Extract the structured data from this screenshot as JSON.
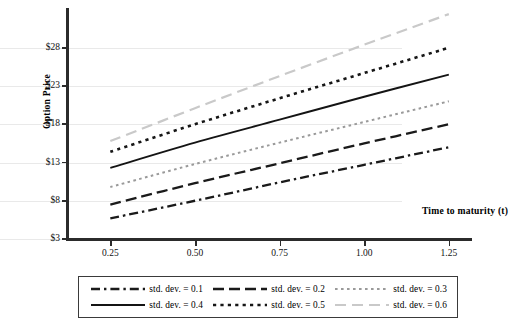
{
  "chart_data": {
    "type": "line",
    "title": "",
    "xlabel": "Time to maturity (t)",
    "ylabel": "Option Price",
    "xlim": [
      0.125,
      1.3125
    ],
    "ylim": [
      3,
      33.2
    ],
    "grid": true,
    "legend_position": "bottom",
    "xticks": [
      0.25,
      0.5,
      0.75,
      1.0,
      1.25
    ],
    "xtick_labels": [
      "0.25",
      "0.50",
      "0.75",
      "1.00",
      "1.25"
    ],
    "yticks": [
      3,
      8,
      13,
      18,
      23,
      28
    ],
    "ytick_labels": [
      "$3",
      "$8",
      "$13",
      "$18",
      "$23",
      "$28"
    ],
    "x": [
      0.25,
      0.5,
      0.75,
      1.0,
      1.25
    ],
    "series": [
      {
        "name": "std. dev. = 0.1",
        "style": "dash-dot",
        "color": "#1a1a1a",
        "values": [
          5.7,
          8.0,
          10.4,
          12.7,
          15.0
        ]
      },
      {
        "name": "std. dev. = 0.2",
        "style": "long-dash",
        "color": "#1a1a1a",
        "values": [
          7.5,
          10.3,
          12.9,
          15.5,
          18.0
        ]
      },
      {
        "name": "std. dev. = 0.3",
        "style": "fine-dot",
        "color": "#9a9a9a",
        "values": [
          9.8,
          12.8,
          15.6,
          18.3,
          21.0
        ]
      },
      {
        "name": "std. dev. = 0.4",
        "style": "solid",
        "color": "#141414",
        "values": [
          12.3,
          15.6,
          18.6,
          21.6,
          24.5
        ]
      },
      {
        "name": "std. dev. = 0.5",
        "style": "square-dot",
        "color": "#161616",
        "values": [
          14.4,
          18.0,
          21.4,
          24.7,
          28.0
        ]
      },
      {
        "name": "std. dev. = 0.6",
        "style": "gray-long-dash",
        "color": "#c9c9c9",
        "values": [
          15.8,
          20.1,
          24.3,
          28.4,
          32.4
        ]
      }
    ]
  },
  "legend": {
    "entries": [
      {
        "label": "std. dev. = 0.1"
      },
      {
        "label": "std. dev. = 0.2"
      },
      {
        "label": "std. dev. = 0.3"
      },
      {
        "label": "std. dev. = 0.4"
      },
      {
        "label": "std. dev. = 0.5"
      },
      {
        "label": "std. dev. = 0.6"
      }
    ]
  }
}
